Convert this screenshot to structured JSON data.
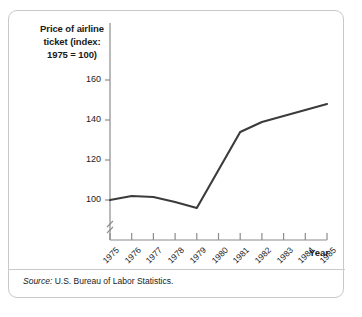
{
  "figure": {
    "title": "Price of airline ticket (index: 1975 = 100)",
    "title_line1": "Price of airline",
    "title_line2": "ticket (index:",
    "title_line3": "1975 = 100)",
    "axis_label_x": "Year",
    "source_lead": "Source:",
    "source_text": "U.S. Bureau of Labor Statistics.",
    "line_color": "#3b3b3b",
    "axis_color": "#8c8c8c",
    "border_color": "#c9c9c9",
    "text_color": "#1a1a1a"
  },
  "chart_data": {
    "type": "line",
    "title": "Price of airline ticket (index: 1975 = 100)",
    "xlabel": "Year",
    "ylabel": "Price of airline ticket (index: 1975 = 100)",
    "x": [
      1975,
      1976,
      1977,
      1978,
      1979,
      1980,
      1981,
      1982,
      1983,
      1984,
      1985
    ],
    "categories": [
      "1975",
      "1976",
      "1977",
      "1978",
      "1979",
      "1980",
      "1981",
      "1982",
      "1983",
      "1984",
      "1985"
    ],
    "values": [
      100,
      102,
      101.5,
      99,
      96,
      115,
      134,
      139,
      142,
      145,
      148
    ],
    "series": [
      {
        "name": "Price of airline ticket (index: 1975 = 100)",
        "values": [
          100,
          102,
          101.5,
          99,
          96,
          115,
          134,
          139,
          142,
          145,
          148
        ]
      }
    ],
    "ylim": [
      90,
      168
    ],
    "yticks": [
      100,
      120,
      140,
      160
    ],
    "ytick_labels": [
      "100",
      "120",
      "140",
      "160"
    ],
    "xtick_labels": [
      "1975",
      "1976",
      "1977",
      "1978",
      "1979",
      "1980",
      "1981",
      "1982",
      "1983",
      "1984",
      "1985"
    ],
    "grid": false,
    "legend": false,
    "axis_break_y": true,
    "annotations": [
      "Source: U.S. Bureau of Labor Statistics."
    ]
  }
}
